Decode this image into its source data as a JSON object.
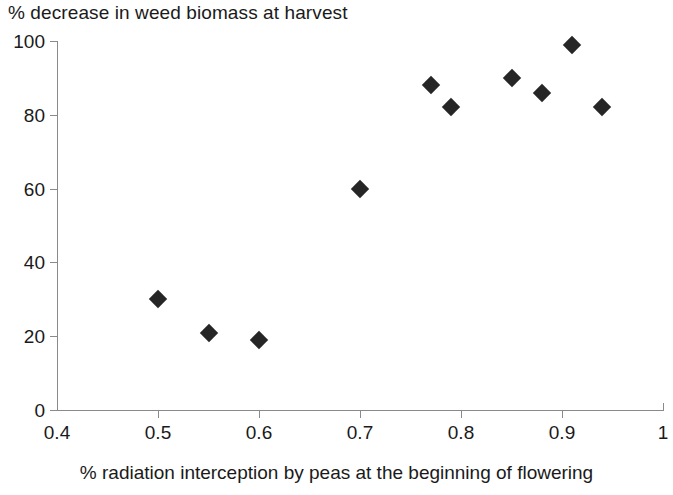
{
  "chart_data": {
    "type": "scatter",
    "title": "% decrease in weed biomass at harvest",
    "xlabel": "% radiation interception by peas at the beginning of flowering",
    "ylabel": "",
    "xlim": [
      0.4,
      1
    ],
    "ylim": [
      0,
      100
    ],
    "grid": false,
    "legend": null,
    "marker": "filled-diamond",
    "marker_color": "#262626",
    "axis_color": "#8a8a8a",
    "xticks": [
      "0.4",
      "0.5",
      "0.6",
      "0.7",
      "0.8",
      "0.9",
      "1"
    ],
    "xtick_values": [
      0.4,
      0.5,
      0.6,
      0.7,
      0.8,
      0.9,
      1
    ],
    "yticks": [
      "0",
      "20",
      "40",
      "60",
      "80",
      "100"
    ],
    "ytick_values": [
      0,
      20,
      40,
      60,
      80,
      100
    ],
    "x": [
      0.5,
      0.55,
      0.6,
      0.7,
      0.77,
      0.79,
      0.85,
      0.88,
      0.91,
      0.94
    ],
    "y": [
      30,
      21,
      19,
      60,
      88,
      82,
      90,
      86,
      99,
      82
    ],
    "points": [
      {
        "x": 0.5,
        "y": 30
      },
      {
        "x": 0.55,
        "y": 21
      },
      {
        "x": 0.6,
        "y": 19
      },
      {
        "x": 0.7,
        "y": 60
      },
      {
        "x": 0.77,
        "y": 88
      },
      {
        "x": 0.79,
        "y": 82
      },
      {
        "x": 0.85,
        "y": 90
      },
      {
        "x": 0.88,
        "y": 86
      },
      {
        "x": 0.91,
        "y": 99
      },
      {
        "x": 0.94,
        "y": 82
      }
    ]
  }
}
